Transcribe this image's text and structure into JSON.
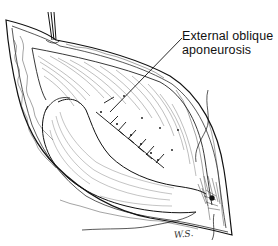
{
  "figure": {
    "type": "surgical-illustration",
    "style": "black-and-white pen-and-ink",
    "colors": {
      "ink": "#111111",
      "paper": "#ffffff"
    }
  },
  "labels": {
    "external_oblique": {
      "line1": "External oblique",
      "line2": "aponeurosis"
    }
  },
  "signature": "W.S."
}
